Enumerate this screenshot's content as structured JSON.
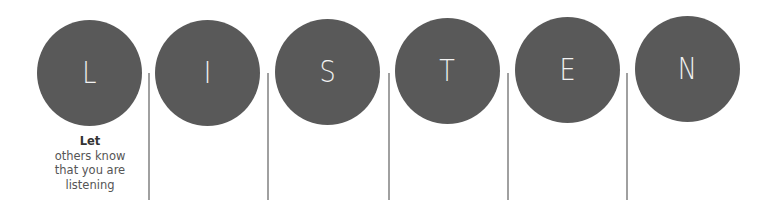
{
  "title": "LISTEN",
  "colors": {
    "circle": "#595959",
    "letter": "#f2f2f2",
    "divider": "#a0a0a0",
    "caption": "#555555"
  },
  "letters": [
    {
      "letter": "L",
      "x": 37,
      "y": 20
    },
    {
      "letter": "I",
      "x": 155,
      "y": 20
    },
    {
      "letter": "S",
      "x": 275,
      "y": 19
    },
    {
      "letter": "T",
      "x": 395,
      "y": 18
    },
    {
      "letter": "E",
      "x": 515,
      "y": 17
    },
    {
      "letter": "N",
      "x": 635,
      "y": 16
    }
  ],
  "dividers": [
    148,
    267,
    388,
    507,
    626
  ],
  "caption": {
    "heading": "Let",
    "lines": [
      "others know",
      "that you are",
      "listening"
    ]
  }
}
